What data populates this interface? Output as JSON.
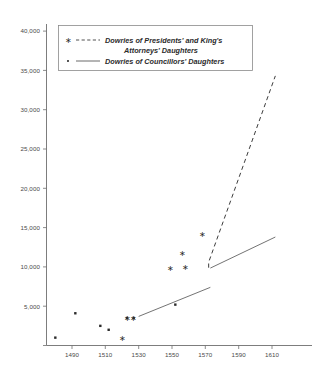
{
  "chart_data": {
    "type": "scatter",
    "title": "",
    "xlabel": "",
    "ylabel": "",
    "xlim": [
      1478,
      1618
    ],
    "ylim": [
      0,
      41500
    ],
    "grid": false,
    "legend_position": "top-left",
    "x_ticks": [
      "1490",
      "1510",
      "1530",
      "1550",
      "1570",
      "1590",
      "1610"
    ],
    "x_tick_values": [
      1490,
      1510,
      1530,
      1550,
      1570,
      1590,
      1610
    ],
    "y_ticks": [
      "5,000",
      "10,000",
      "15,000",
      "20,000",
      "25,000",
      "30,000",
      "35,000",
      "40,000"
    ],
    "y_tick_values": [
      5000,
      10000,
      15000,
      20000,
      25000,
      30000,
      35000,
      40000
    ],
    "series": [
      {
        "name": "Dowries of Presidents' and King's Attorneys' Daughters",
        "marker": "asterisk",
        "line_style": "dashed",
        "points": [
          {
            "x": 1520,
            "y": 1000
          },
          {
            "x": 1523,
            "y": 3500
          },
          {
            "x": 1527,
            "y": 3500
          },
          {
            "x": 1549,
            "y": 9800
          },
          {
            "x": 1556,
            "y": 11800
          },
          {
            "x": 1558,
            "y": 10000
          },
          {
            "x": 1568,
            "y": 14200
          }
        ],
        "trend": [
          {
            "x": 1572,
            "y": 9900
          },
          {
            "x": 1572,
            "y": 10600
          },
          {
            "x": 1612,
            "y": 34300
          }
        ]
      },
      {
        "name": "Dowries of Councillors' Daughters",
        "marker": "dot",
        "line_style": "solid",
        "points": [
          {
            "x": 1480,
            "y": 1000
          },
          {
            "x": 1492,
            "y": 4100
          },
          {
            "x": 1507,
            "y": 2500
          },
          {
            "x": 1512,
            "y": 2000
          },
          {
            "x": 1523,
            "y": 3500
          },
          {
            "x": 1527,
            "y": 3500
          },
          {
            "x": 1552,
            "y": 5200
          }
        ],
        "trend": [
          {
            "x": 1530,
            "y": 3700
          },
          {
            "x": 1573,
            "y": 7400
          },
          {
            "x": 1573,
            "y": 9850
          },
          {
            "x": 1612,
            "y": 13800
          }
        ]
      }
    ]
  },
  "legend": {
    "entries": [
      {
        "marker_glyph": "∗",
        "line": "dashed",
        "label_line1": "Dowries of Presidents' and King's",
        "label_line2": "Attorneys' Daughters"
      },
      {
        "marker_glyph": "·",
        "line": "solid",
        "label_line1": "Dowries of Councillors' Daughters",
        "label_line2": ""
      }
    ]
  },
  "colors": {
    "axis": "#6e6e6e",
    "marker": "#2b2b2b",
    "dashed_trend": "#3c3c3c",
    "solid_trend": "#5a5a5a",
    "background": "#ffffff",
    "text": "#3a3a3a"
  }
}
